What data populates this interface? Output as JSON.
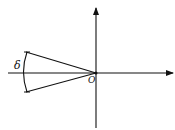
{
  "diagram": {
    "type": "geometric-angle-diagram",
    "origin_label": "O",
    "angle_label": "δ",
    "colors": {
      "stroke": "#111111",
      "background": "#ffffff"
    },
    "elements": [
      {
        "kind": "axis",
        "direction": "horizontal",
        "arrow": "right"
      },
      {
        "kind": "axis",
        "direction": "vertical",
        "arrow": "up"
      },
      {
        "kind": "ray",
        "from": "origin",
        "to": "upper-left"
      },
      {
        "kind": "ray",
        "from": "origin",
        "to": "lower-left"
      },
      {
        "kind": "arc",
        "between": [
          "upper-ray",
          "lower-ray"
        ],
        "label": "δ"
      }
    ]
  }
}
